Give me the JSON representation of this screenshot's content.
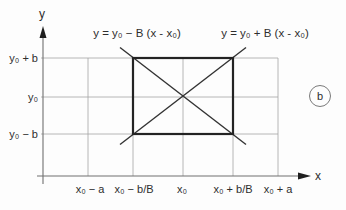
{
  "figure": {
    "panel_label": "b",
    "axes": {
      "x_label": "x",
      "y_label": "y"
    },
    "equations": {
      "falling_line": "y = y₀ − B (x - x₀)",
      "rising_line": "y = y₀ + B (x - x₀)"
    },
    "y_ticks": [
      "y₀ + b",
      "y₀",
      "y₀ − b"
    ],
    "x_ticks": [
      "x₀ − a",
      "x₀ − b/B",
      "x₀",
      "x₀ + b/B",
      "x₀ + a"
    ],
    "colors": {
      "background": "#fdfdfd",
      "grid": "#a3a3a3",
      "axis": "#707070",
      "arrow": "#1f1f1f",
      "rectangle": "#232323",
      "diagonal": "#333333",
      "circle_outline": "#7a7a7a",
      "text": "#2e2e2e"
    }
  }
}
